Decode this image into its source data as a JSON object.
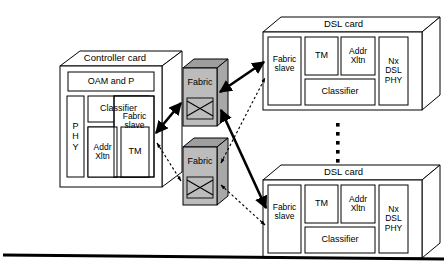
{
  "diagram": {
    "background_color": "#ffffff",
    "line_color": "#000000",
    "fabric_fill_color": "#bcbcbc",
    "fabric_top_color": "#9e9e9e",
    "fabric_side_color": "#a8a8a8",
    "card_fill_color": "#ffffff"
  },
  "controller_card": {
    "title": "Controller card",
    "blocks": {
      "oam": "OAM and P",
      "phy": "P\nH\nY",
      "classifier": "Classifier",
      "addr_xltn": "Addr\nXltn",
      "tm": "TM",
      "fabric_slave": "Fabric\nslave"
    }
  },
  "fabrics": [
    {
      "label": "Fabric",
      "icon": "crossover-switch-icon"
    },
    {
      "label": "Fabric",
      "icon": "crossover-switch-icon"
    }
  ],
  "dsl_cards": [
    {
      "title": "DSL card",
      "blocks": {
        "fabric_slave": "Fabric\nslave",
        "tm": "TM",
        "addr_xltn": "Addr\nXltn",
        "classifier": "Classifier",
        "phy": "Nx\nDSL\nPHY"
      }
    },
    {
      "title": "DSL card",
      "blocks": {
        "fabric_slave": "Fabric\nslave",
        "tm": "TM",
        "addr_xltn": "Addr\nXltn",
        "classifier": "Classifier",
        "phy": "Nx\nDSL\nPHY"
      }
    }
  ],
  "ellipsis": {
    "name": "vertical-ellipsis",
    "dot_count": 5
  },
  "connections": [
    {
      "from": "controller-fabric-slave",
      "to": "fabric-1",
      "style": "solid",
      "arrows": "both"
    },
    {
      "from": "controller-fabric-slave",
      "to": "fabric-2",
      "style": "dotted",
      "arrows": "both"
    },
    {
      "from": "fabric-1",
      "to": "dsl-card-1-fabric-slave",
      "style": "solid",
      "arrows": "both"
    },
    {
      "from": "fabric-1",
      "to": "dsl-card-2-fabric-slave",
      "style": "solid",
      "arrows": "both"
    },
    {
      "from": "fabric-2",
      "to": "dsl-card-1-fabric-slave",
      "style": "dotted",
      "arrows": "both"
    },
    {
      "from": "fabric-2",
      "to": "dsl-card-2-fabric-slave",
      "style": "dotted",
      "arrows": "both"
    }
  ],
  "footer_rule": {
    "name": "bottom-horizontal-rule"
  }
}
